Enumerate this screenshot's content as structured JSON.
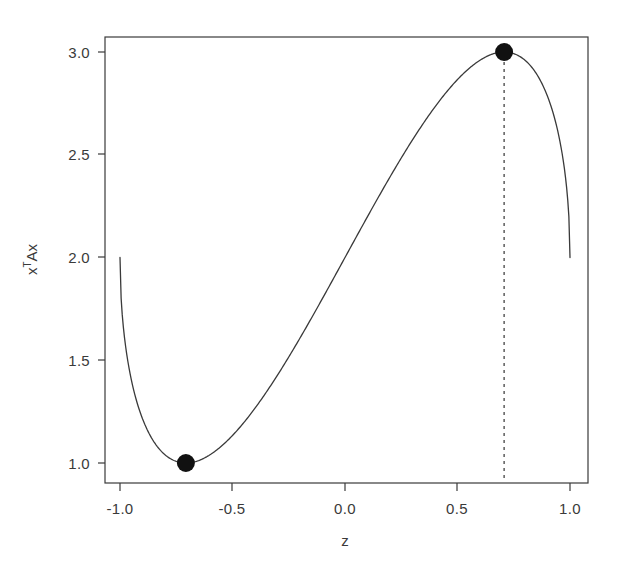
{
  "figure": {
    "background_color": "#ffffff",
    "foreground_color": "#3a3a3a",
    "width": 619,
    "height": 574
  },
  "axes": {
    "x_title": "z",
    "y_title_base": "x",
    "y_title_sup": "T",
    "y_title_tail": "Ax",
    "y_title_plain": "xTAx",
    "x_ticks": [
      "-1.0",
      "-0.5",
      "0.0",
      "0.5",
      "1.0"
    ],
    "y_ticks": [
      "1.0",
      "1.5",
      "2.0",
      "2.5",
      "3.0"
    ]
  },
  "chart_data": {
    "type": "line",
    "title": "",
    "xlabel": "z",
    "ylabel": "xTAx",
    "xlim": [
      -1.0,
      1.0
    ],
    "ylim": [
      1.0,
      3.0
    ],
    "grid": false,
    "legend": "none",
    "x_ticks": [
      -1.0,
      -0.5,
      0.0,
      0.5,
      1.0
    ],
    "y_ticks": [
      1.0,
      1.5,
      2.0,
      2.5,
      3.0
    ],
    "series": [
      {
        "name": "xTAx",
        "style": "solid",
        "color": "#3a3a3a",
        "x": [
          -1.0,
          -0.97,
          -0.94,
          -0.91,
          -0.88,
          -0.85,
          -0.82,
          -0.79,
          -0.76,
          -0.73,
          -0.7071,
          -0.68,
          -0.65,
          -0.6,
          -0.55,
          -0.5,
          -0.45,
          -0.4,
          -0.35,
          -0.3,
          -0.25,
          -0.2,
          -0.15,
          -0.1,
          -0.05,
          0.0,
          0.05,
          0.1,
          0.15,
          0.2,
          0.25,
          0.3,
          0.35,
          0.4,
          0.45,
          0.5,
          0.55,
          0.6,
          0.65,
          0.68,
          0.7071,
          0.73,
          0.76,
          0.79,
          0.82,
          0.85,
          0.88,
          0.91,
          0.94,
          0.97,
          1.0
        ],
        "y": [
          2.0,
          1.6402,
          1.4204,
          1.2787,
          1.1851,
          1.1233,
          1.0838,
          1.0606,
          1.0501,
          1.0498,
          1.05,
          1.0531,
          1.0676,
          1.1056,
          1.1669,
          1.25,
          1.3532,
          1.4749,
          1.6132,
          1.7662,
          1.9319,
          2.1077,
          2.2906,
          2.4761,
          2.6575,
          2.8235,
          2.9546,
          3.0198,
          2.9816,
          2.8441,
          2.6583,
          2.4663,
          2.2928,
          2.1509,
          2.0459,
          1.979,
          1.9521,
          1.9708,
          2.0485,
          2.1214,
          2.2071,
          2.3126,
          2.4522,
          2.6345,
          2.8634,
          3.1321,
          3.4216,
          3.7004,
          3.928,
          4.0571,
          4.0
        ],
        "note": "rendered path is the visible curve: rises from 2.0 at z=-1 to a min of 1.0 near z=-0.707, increases monotonically to a max of 3.0 near z=0.707, then drops steeply back to 2.0 at z=1.0"
      }
    ],
    "markers": [
      {
        "name": "minimum-point",
        "x": -0.7071,
        "y": 1.0,
        "label": "minimum eigenvalue",
        "shape": "filled-circle",
        "color": "#111111"
      },
      {
        "name": "maximum-point",
        "x": 0.7071,
        "y": 3.0,
        "label": "maximum eigenvalue",
        "shape": "filled-circle",
        "color": "#111111"
      }
    ],
    "annotations": [
      {
        "name": "max-dropline",
        "type": "vline",
        "x": 0.7071,
        "y_from": 3.0,
        "y_to": 1.0,
        "style": "dashed",
        "color": "#333333"
      }
    ],
    "endpoints": [
      {
        "x": -1.0,
        "y": 2.0
      },
      {
        "x": 1.0,
        "y": 2.0
      }
    ]
  }
}
